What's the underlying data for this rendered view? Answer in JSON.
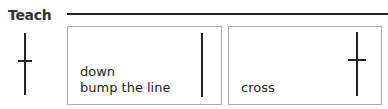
{
  "section": {
    "title": "Teach"
  },
  "cards": [
    {
      "line1": "down",
      "line2": "bump the line",
      "icon": "vertical-stroke-icon"
    },
    {
      "line1": "cross",
      "icon": "cross-stroke-icon"
    }
  ],
  "colors": {
    "ink": "#222222",
    "border": "#aaaaaa"
  }
}
